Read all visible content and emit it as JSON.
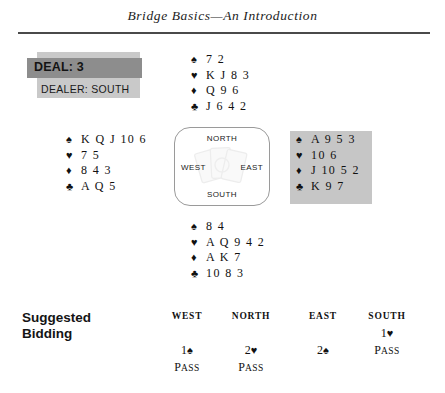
{
  "header": {
    "title": "Bridge Basics—An Introduction"
  },
  "deal_info": {
    "deal_label": "DEAL: 3",
    "dealer_label": "DEALER: SOUTH",
    "band_color": "#8d8d8d",
    "panel_color": "#c9c9c9"
  },
  "compass": {
    "north": "NORTH",
    "south": "SOUTH",
    "east": "EAST",
    "west": "WEST"
  },
  "hands": {
    "north": {
      "spades_symbol": "♠",
      "spades": "7 2",
      "hearts_symbol": "♥",
      "hearts": "K J 8 3",
      "diamonds_symbol": "♦",
      "diamonds": "Q 9 6",
      "clubs_symbol": "♣",
      "clubs": "J 6 4 2"
    },
    "west": {
      "spades_symbol": "♠",
      "spades": "K Q J 10 6",
      "hearts_symbol": "♥",
      "hearts": "7 5",
      "diamonds_symbol": "♦",
      "diamonds": "8 4 3",
      "clubs_symbol": "♣",
      "clubs": "A Q 5"
    },
    "east": {
      "spades_symbol": "♠",
      "spades": "A 9 5 3",
      "hearts_symbol": "♥",
      "hearts": "10 6",
      "diamonds_symbol": "♦",
      "diamonds": "J 10 5 2",
      "clubs_symbol": "♣",
      "clubs": "K 9 7",
      "highlight_color": "#c6c6c6"
    },
    "south": {
      "spades_symbol": "♠",
      "spades": "8 4",
      "hearts_symbol": "♥",
      "hearts": "A Q 9 4 2",
      "diamonds_symbol": "♦",
      "diamonds": "A K 7",
      "clubs_symbol": "♣",
      "clubs": "10 8 3"
    }
  },
  "bidding": {
    "title_line1": "Suggested",
    "title_line2": "Bidding",
    "columns": [
      {
        "header": "WEST",
        "cells": [
          {
            "text": "",
            "small_caps": false
          },
          {
            "text": "1",
            "suit": "♠",
            "small_caps": false
          },
          {
            "text": "Pass",
            "small_caps": true
          }
        ]
      },
      {
        "header": "NORTH",
        "cells": [
          {
            "text": "",
            "small_caps": false
          },
          {
            "text": "2",
            "suit": "♥",
            "small_caps": false
          },
          {
            "text": "Pass",
            "small_caps": true
          }
        ]
      },
      {
        "header": "EAST",
        "cells": [
          {
            "text": "",
            "small_caps": false
          },
          {
            "text": "2",
            "suit": "♠",
            "small_caps": false
          },
          {
            "text": "",
            "small_caps": false
          }
        ]
      },
      {
        "header": "SOUTH",
        "cells": [
          {
            "text": "1",
            "suit": "♥",
            "small_caps": false
          },
          {
            "text": "Pass",
            "small_caps": true
          },
          {
            "text": "",
            "small_caps": false
          }
        ]
      }
    ]
  }
}
